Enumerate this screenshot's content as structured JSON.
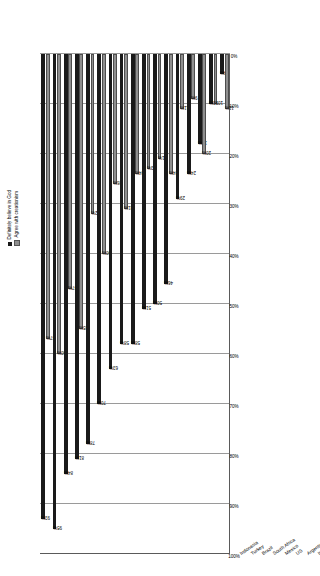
{
  "chart_data": {
    "type": "bar",
    "title": "",
    "xlabel": "",
    "ylabel": "",
    "ylim": [
      0,
      100
    ],
    "grid": true,
    "legend_position": "top-right",
    "axis_ticks": [
      "100%",
      "90%",
      "80%",
      "70%",
      "60%",
      "50%",
      "40%",
      "30%",
      "20%",
      "10%",
      "0%"
    ],
    "categories": [
      "Indonesia",
      "Turkey",
      "Brazil",
      "South Africa",
      "Mexico",
      "US",
      "Argentina",
      "Italy",
      "Spain",
      "Poland",
      "Russia",
      "Britain",
      "France",
      "South Korea",
      "Sweden",
      "Czech",
      "Japan"
    ],
    "series": [
      {
        "name": "Definitely believe in God",
        "color": "#1a1a1a",
        "values": [
          93,
          95,
          84,
          81,
          78,
          70,
          63,
          58,
          58,
          51,
          50,
          46,
          29,
          24,
          18,
          10,
          4
        ],
        "labels": [
          "93%",
          "95%",
          "84%",
          "81%",
          "78%",
          "70%",
          "63%",
          "58%",
          "58%",
          "51%",
          "50%",
          "46%",
          "29%",
          "24%",
          "18%",
          "10%",
          "4%"
        ]
      },
      {
        "name": "Agree with creationism",
        "color": "#8f8f8f",
        "values": [
          57,
          60,
          47,
          55,
          32,
          40,
          26,
          31,
          24,
          23,
          21,
          24,
          11,
          9,
          20,
          10,
          11
        ],
        "labels": [
          "57%",
          "60%",
          "47%",
          "55%",
          "32%",
          "40%",
          "26%",
          "31%",
          "24%",
          "23%",
          "21%",
          "24%",
          "11%",
          "9%",
          "20%",
          "10%",
          "11%"
        ]
      }
    ]
  },
  "legend": {
    "items": [
      {
        "label": "Definitely believe in God",
        "swatch": "dark"
      },
      {
        "label": "Agree with creationism",
        "swatch": "grey"
      }
    ]
  }
}
